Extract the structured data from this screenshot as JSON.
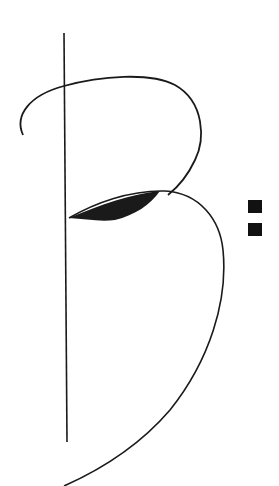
{
  "logo": {
    "letter": "B",
    "punctuation": ":",
    "stroke_color": "#1a1a1a",
    "background_color": "#ffffff"
  }
}
